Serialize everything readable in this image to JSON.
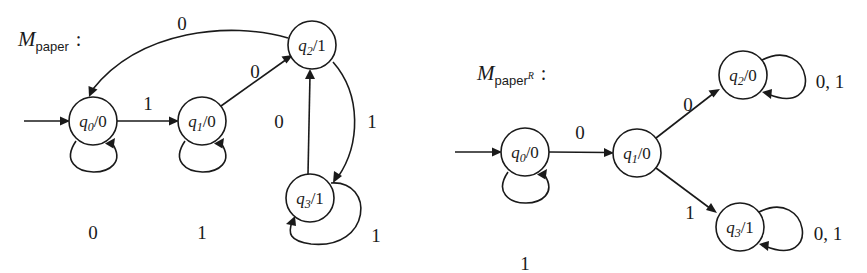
{
  "figure": {
    "background": "#ffffff",
    "ink": "#1a1a1a"
  },
  "machines": [
    {
      "id": "m-paper",
      "name_base": "M",
      "name_sub": "paper",
      "name_sup": "",
      "colon": ":",
      "label_x": 18,
      "label_y": 46,
      "states": [
        {
          "id": "q0",
          "label_q": "q",
          "label_idx": "0",
          "label_sep": "/",
          "label_out": "0",
          "cx": 93,
          "cy": 121,
          "r": 24
        },
        {
          "id": "q1",
          "label_q": "q",
          "label_idx": "1",
          "label_sep": "/",
          "label_out": "0",
          "cx": 202,
          "cy": 121,
          "r": 24
        },
        {
          "id": "q2",
          "label_q": "q",
          "label_idx": "2",
          "label_sep": "/",
          "label_out": "1",
          "cx": 312,
          "cy": 45,
          "r": 24
        },
        {
          "id": "q3",
          "label_q": "q",
          "label_idx": "3",
          "label_sep": "/",
          "label_out": "1",
          "cx": 310,
          "cy": 198,
          "r": 24
        }
      ],
      "start_arrow": {
        "from_x": 24,
        "to_x": 67,
        "y": 121
      },
      "transitions": [
        {
          "from": "q0",
          "to": "q0",
          "label": "0",
          "kind": "self-loop-below",
          "lx": 93,
          "ly": 232
        },
        {
          "from": "q0",
          "to": "q1",
          "label": "1",
          "kind": "straight",
          "lx": 148,
          "ly": 108
        },
        {
          "from": "q1",
          "to": "q1",
          "label": "1",
          "kind": "self-loop-below",
          "lx": 202,
          "ly": 232
        },
        {
          "from": "q1",
          "to": "q2",
          "label": "0",
          "kind": "diagonal-up",
          "lx": 255,
          "ly": 72
        },
        {
          "from": "q2",
          "to": "q0",
          "label": "0",
          "kind": "long-curve-left",
          "lx": 182,
          "ly": 25
        },
        {
          "from": "q2",
          "to": "q3",
          "label": "1",
          "kind": "curve-down",
          "lx": 368,
          "ly": 122
        },
        {
          "from": "q3",
          "to": "q2",
          "label": "0",
          "kind": "straight-up",
          "lx": 280,
          "ly": 122
        },
        {
          "from": "q3",
          "to": "q3",
          "label": "1",
          "kind": "self-loop-right-below",
          "lx": 375,
          "ly": 235
        }
      ]
    },
    {
      "id": "m-paper-r",
      "name_base": "M",
      "name_sub": "paper",
      "name_sup": "R",
      "colon": ":",
      "label_x": 477,
      "label_y": 80,
      "states": [
        {
          "id": "q0",
          "label_q": "q",
          "label_idx": "0",
          "label_sep": "/",
          "label_out": "0",
          "cx": 525,
          "cy": 152,
          "r": 24
        },
        {
          "id": "q1",
          "label_q": "q",
          "label_idx": "1",
          "label_sep": "/",
          "label_out": "0",
          "cx": 637,
          "cy": 153,
          "r": 24
        },
        {
          "id": "q2",
          "label_q": "q",
          "label_idx": "2",
          "label_sep": "/",
          "label_out": "0",
          "cx": 743,
          "cy": 75,
          "r": 24
        },
        {
          "id": "q3",
          "label_q": "q",
          "label_idx": "3",
          "label_sep": "/",
          "label_out": "1",
          "cx": 740,
          "cy": 227,
          "r": 24
        }
      ],
      "start_arrow": {
        "from_x": 455,
        "to_x": 499,
        "y": 152
      },
      "transitions": [
        {
          "from": "q0",
          "to": "q0",
          "label": "1",
          "kind": "self-loop-below",
          "lx": 525,
          "ly": 263
        },
        {
          "from": "q0",
          "to": "q1",
          "label": "0",
          "kind": "straight",
          "lx": 580,
          "ly": 133
        },
        {
          "from": "q1",
          "to": "q2",
          "label": "0",
          "kind": "diagonal-up",
          "lx": 688,
          "ly": 105
        },
        {
          "from": "q1",
          "to": "q3",
          "label": "1",
          "kind": "diagonal-down",
          "lx": 690,
          "ly": 213
        },
        {
          "from": "q2",
          "to": "q2",
          "label": "0, 1",
          "kind": "self-loop-right",
          "lx": 830,
          "ly": 82
        },
        {
          "from": "q3",
          "to": "q3",
          "label": "0, 1",
          "kind": "self-loop-right",
          "lx": 828,
          "ly": 234
        }
      ]
    }
  ]
}
